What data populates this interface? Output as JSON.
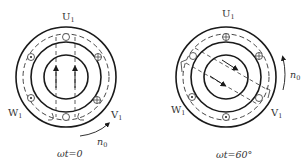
{
  "diagrams": [
    {
      "caption": "ωt=0",
      "labels": {
        "top": "U",
        "top_sub": "1",
        "left": "W",
        "left_sub": "1",
        "right": "V",
        "right_sub": "1"
      },
      "speed_label": "n",
      "speed_sub": "0",
      "field_angle_deg": 0,
      "conductors": [
        {
          "symbol": "none",
          "angle_deg": 90
        },
        {
          "symbol": "plus",
          "angle_deg": 30
        },
        {
          "symbol": "plus",
          "angle_deg": -30
        },
        {
          "symbol": "none",
          "angle_deg": -90
        },
        {
          "symbol": "dot",
          "angle_deg": -150
        },
        {
          "symbol": "dot",
          "angle_deg": 150
        }
      ]
    },
    {
      "caption": "ωt=60°",
      "labels": {
        "top": "U",
        "top_sub": "1",
        "left": "W",
        "left_sub": "1",
        "right": "V",
        "right_sub": "1"
      },
      "speed_label": "n",
      "speed_sub": "0",
      "field_angle_deg": -60,
      "conductors": [
        {
          "symbol": "plus",
          "angle_deg": 90
        },
        {
          "symbol": "plus",
          "angle_deg": 30
        },
        {
          "symbol": "none",
          "angle_deg": -30
        },
        {
          "symbol": "dot",
          "angle_deg": -90
        },
        {
          "symbol": "dot",
          "angle_deg": -150
        },
        {
          "symbol": "none",
          "angle_deg": 150
        }
      ]
    }
  ]
}
